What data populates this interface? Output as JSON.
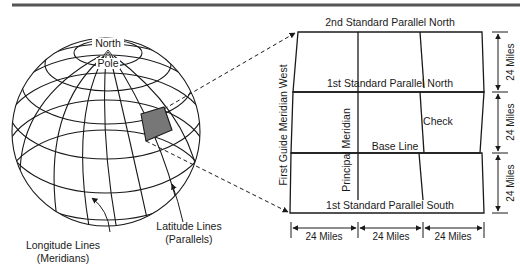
{
  "figure": {
    "type": "public land survey diagram",
    "top_rule_color": "#555555",
    "line_color": "#1a1a1a",
    "highlight_fill": "#777777"
  },
  "globe": {
    "pole_label_line1": "North",
    "pole_label_line2": "Pole",
    "longitude_label_line1": "Longitude Lines",
    "longitude_label_line2": "(Meridians)",
    "latitude_label_line1": "Latitude Lines",
    "latitude_label_line2": "(Parallels)"
  },
  "grid": {
    "top_label": "2nd Standard Parallel North",
    "parallel_north_label": "1st Standard Parallel North",
    "parallel_south_label": "1st Standard Parallel South",
    "base_line_label": "Base Line",
    "principal_meridian_label": "Principal Meridian",
    "guide_meridian_label": "First Guide Meridian West",
    "check_label": "Check"
  },
  "dimensions": {
    "vertical": [
      "24 Miles",
      "24 Miles",
      "24 Miles"
    ],
    "horizontal": [
      "24 Miles",
      "24 Miles",
      "24 Miles"
    ]
  }
}
